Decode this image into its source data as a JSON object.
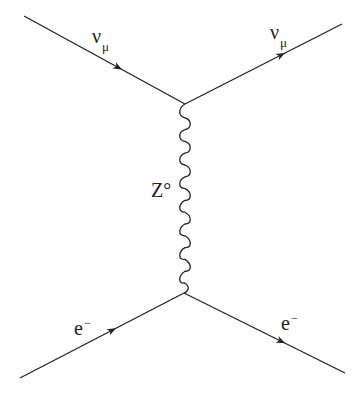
{
  "diagram": {
    "type": "feynman",
    "process": "neutral current neutrino-electron scattering",
    "colors": {
      "line": "#222222",
      "background": "#ffffff"
    },
    "vertices": [
      {
        "id": "v_top",
        "x": 185,
        "y": 104
      },
      {
        "id": "v_bottom",
        "x": 184,
        "y": 293
      }
    ],
    "lines": [
      {
        "id": "nu_in",
        "kind": "fermion",
        "from": [
          24,
          16
        ],
        "to": [
          185,
          104
        ],
        "arrow": "forward"
      },
      {
        "id": "nu_out",
        "kind": "fermion",
        "from": [
          185,
          104
        ],
        "to": [
          342,
          24
        ],
        "arrow": "forward"
      },
      {
        "id": "e_in",
        "kind": "fermion",
        "from": [
          20,
          378
        ],
        "to": [
          184,
          293
        ],
        "arrow": "forward"
      },
      {
        "id": "e_out",
        "kind": "fermion",
        "from": [
          184,
          293
        ],
        "to": [
          345,
          373
        ],
        "arrow": "forward"
      },
      {
        "id": "z_boson",
        "kind": "boson-wavy",
        "from": [
          185,
          104
        ],
        "to": [
          184,
          293
        ],
        "waves": 8
      }
    ],
    "labels": {
      "nu_in": {
        "main": "ν",
        "sub": "μ"
      },
      "nu_out": {
        "main": "ν",
        "sub": "μ"
      },
      "z_boson": {
        "main": "Z°"
      },
      "e_in": {
        "main": "e",
        "sup": "−"
      },
      "e_out": {
        "main": "e",
        "sup": "−"
      }
    }
  }
}
